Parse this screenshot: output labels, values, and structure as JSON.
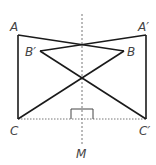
{
  "diagram": {
    "type": "geometry-reflection",
    "colors": {
      "stroke": "#1a1a1a",
      "axis": "#777777",
      "label": "#444444"
    },
    "labels": {
      "A": "A",
      "A_prime": "A′",
      "B": "B",
      "B_prime": "B′",
      "C": "C",
      "C_prime": "C′",
      "M": "M"
    },
    "points": {
      "A": [
        18,
        35
      ],
      "A_prime": [
        146,
        35
      ],
      "B": [
        124,
        51
      ],
      "B_prime": [
        40,
        51
      ],
      "C": [
        18,
        119
      ],
      "C_prime": [
        146,
        119
      ],
      "M": [
        82,
        150
      ]
    },
    "symmetry_axis": "vertical dashed line through M",
    "right_angle_marker": "at foot of axis on segment CC′"
  }
}
